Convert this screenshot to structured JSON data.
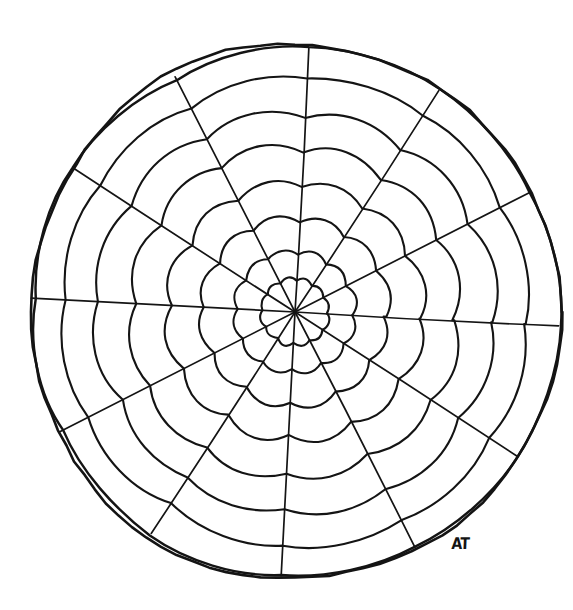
{
  "page": {
    "background_color": "#ffffff",
    "ink_color": "#141414",
    "width": 573,
    "height": 610
  },
  "artwork": {
    "type": "rosette-mandala",
    "description": "Hand-drawn circular mandala / rosette coloring outline with twelve radial spokes and eight concentric scalloped petal rings",
    "style": "black line art on white, no fill",
    "center": {
      "x": 295,
      "y": 312
    },
    "outer_radius": 265,
    "spoke_count": 12,
    "petal_count_per_ring": 12,
    "ring_count": 8,
    "ring_radii": [
      32,
      58,
      90,
      124,
      160,
      196,
      231,
      263
    ],
    "ring_bulge": [
      0.34,
      0.32,
      0.3,
      0.26,
      0.21,
      0.15,
      0.09,
      0.03
    ],
    "spoke_angles_deg": [
      3,
      33,
      63,
      93,
      123,
      153,
      183,
      213,
      243,
      273,
      303,
      333
    ],
    "outline_circle": {
      "stroke_width": 2.6,
      "wobble": "hand-drawn, slightly irregular"
    },
    "stroke_widths": {
      "outline": 2.6,
      "ring": 2.1,
      "spoke": 1.7
    },
    "signature": {
      "text": "AT",
      "position": {
        "x": 452,
        "y": 534
      },
      "note": "artist monogram, lower right inside the circle"
    }
  }
}
